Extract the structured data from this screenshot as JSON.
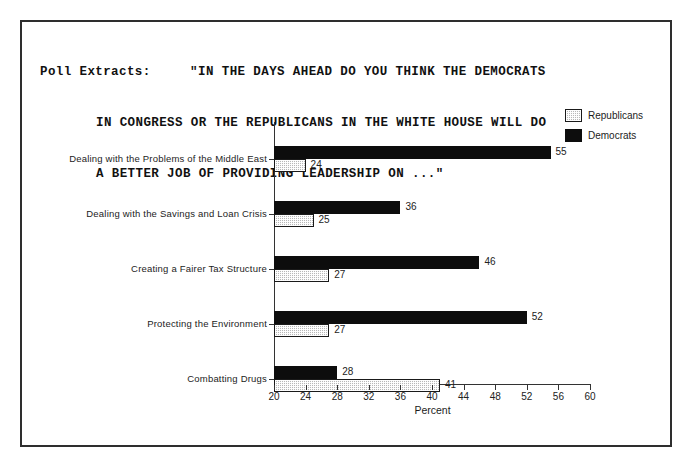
{
  "frame": {
    "title_lines": [
      "Poll Extracts:     \"IN THE DAYS AHEAD DO YOU THINK THE DEMOCRATS",
      "IN CONGRESS OR THE REPUBLICANS IN THE WHITE HOUSE WILL DO",
      "A BETTER JOB OF PROVIDING LEADERSHIP ON ...\""
    ]
  },
  "legend": {
    "position": "top-right",
    "entries": [
      {
        "label": "Republicans",
        "swatch": "hatched-gray",
        "color": "#b8b8b8"
      },
      {
        "label": "Democrats",
        "swatch": "solid-black",
        "color": "#0d0d0d"
      }
    ]
  },
  "chart_data": {
    "type": "bar",
    "orientation": "horizontal",
    "title": "Poll Extracts:     \"IN THE DAYS AHEAD DO YOU THINK THE DEMOCRATS IN CONGRESS OR THE REPUBLICANS IN THE WHITE HOUSE WILL DO A BETTER JOB OF PROVIDING LEADERSHIP ON ...\"",
    "xlabel": "Percent",
    "ylabel": "",
    "xlim": [
      20,
      60
    ],
    "xticks": [
      20,
      24,
      28,
      32,
      36,
      40,
      44,
      48,
      52,
      56,
      60
    ],
    "grid": false,
    "legend_position": "top-right",
    "categories": [
      "Dealing with the Problems of the Middle East",
      "Dealing with the Savings and Loan Crisis",
      "Creating a Fairer Tax Structure",
      "Protecting the Environment",
      "Combatting Drugs"
    ],
    "series": [
      {
        "name": "Democrats",
        "color": "#0d0d0d",
        "values": [
          55,
          36,
          46,
          52,
          28
        ]
      },
      {
        "name": "Republicans",
        "color": "#b8b8b8",
        "values": [
          24,
          25,
          27,
          27,
          41
        ]
      }
    ]
  }
}
